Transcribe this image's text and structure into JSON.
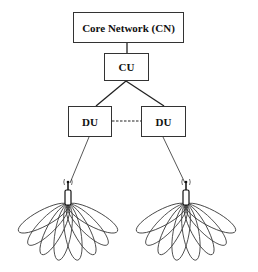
{
  "diagram": {
    "nodes": {
      "cn": {
        "label": "Core Network (CN)"
      },
      "cu": {
        "label": "CU"
      },
      "du_left": {
        "label": "DU"
      },
      "du_right": {
        "label": "DU"
      }
    },
    "edges": [
      {
        "from": "cn",
        "to": "cu",
        "style": "solid"
      },
      {
        "from": "cu",
        "to": "du_left",
        "style": "solid"
      },
      {
        "from": "cu",
        "to": "du_right",
        "style": "solid"
      },
      {
        "from": "du_left",
        "to": "du_right",
        "style": "dashed"
      },
      {
        "from": "du_left",
        "to": "antenna_left",
        "style": "solid"
      },
      {
        "from": "du_right",
        "to": "antenna_right",
        "style": "solid"
      }
    ],
    "antennas": [
      {
        "id": "antenna_left",
        "beams": 8
      },
      {
        "id": "antenna_right",
        "beams": 8
      }
    ]
  }
}
